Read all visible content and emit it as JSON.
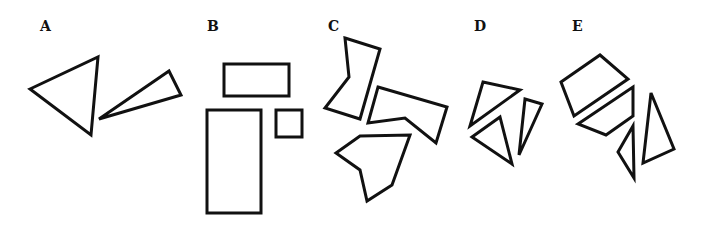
{
  "figure": {
    "stroke_color": "#111111",
    "background": "#ffffff",
    "panels": [
      {
        "label": "A",
        "label_pos": [
          40,
          30
        ],
        "shapes": [
          {
            "type": "triangle",
            "points": [
              [
                30,
                89
              ],
              [
                98,
                57
              ],
              [
                91,
                135
              ]
            ]
          },
          {
            "type": "triangle",
            "points": [
              [
                99,
                119
              ],
              [
                169,
                71
              ],
              [
                181,
                95
              ]
            ]
          }
        ]
      },
      {
        "label": "B",
        "label_pos": [
          208,
          30
        ],
        "shapes": [
          {
            "type": "rect",
            "x": 224,
            "y": 64,
            "w": 65,
            "h": 32
          },
          {
            "type": "rect",
            "x": 207,
            "y": 110,
            "w": 54,
            "h": 103
          },
          {
            "type": "rect",
            "x": 276,
            "y": 110,
            "w": 26,
            "h": 27
          }
        ]
      },
      {
        "label": "C",
        "label_pos": [
          329,
          30
        ],
        "shapes": [
          {
            "type": "polygon",
            "points": [
              [
                345,
                38
              ],
              [
                380,
                49
              ],
              [
                360,
                119
              ],
              [
                325,
                108
              ],
              [
                349,
                77
              ]
            ]
          },
          {
            "type": "polygon",
            "points": [
              [
                378,
                87
              ],
              [
                447,
                107
              ],
              [
                436,
                143
              ],
              [
                405,
                118
              ],
              [
                368,
                123
              ]
            ]
          },
          {
            "type": "polygon",
            "points": [
              [
                360,
                136
              ],
              [
                410,
                135
              ],
              [
                392,
                185
              ],
              [
                367,
                201
              ],
              [
                360,
                170
              ],
              [
                336,
                153
              ]
            ]
          }
        ]
      },
      {
        "label": "D",
        "label_pos": [
          474,
          30
        ],
        "shapes": [
          {
            "type": "triangle",
            "points": [
              [
                483,
                82
              ],
              [
                520,
                90
              ],
              [
                470,
                126
              ]
            ]
          },
          {
            "type": "triangle",
            "points": [
              [
                472,
                137
              ],
              [
                500,
                117
              ],
              [
                512,
                164
              ]
            ]
          },
          {
            "type": "triangle",
            "points": [
              [
                525,
                99
              ],
              [
                542,
                104
              ],
              [
                519,
                155
              ]
            ]
          }
        ]
      },
      {
        "label": "E",
        "label_pos": [
          572,
          30
        ],
        "shapes": [
          {
            "type": "polygon",
            "points": [
              [
                561,
                82
              ],
              [
                600,
                55
              ],
              [
                628,
                79
              ],
              [
                574,
                116
              ]
            ]
          },
          {
            "type": "polygon",
            "points": [
              [
                578,
                124
              ],
              [
                633,
                87
              ],
              [
                633,
                116
              ],
              [
                606,
                135
              ]
            ]
          },
          {
            "type": "triangle",
            "points": [
              [
                633,
                126
              ],
              [
                634,
                178
              ],
              [
                618,
                152
              ]
            ]
          },
          {
            "type": "triangle",
            "points": [
              [
                651,
                93
              ],
              [
                674,
                149
              ],
              [
                643,
                163
              ]
            ]
          }
        ]
      }
    ]
  },
  "labels": {
    "a": "A",
    "b": "B",
    "c": "C",
    "d": "D",
    "e": "E"
  }
}
